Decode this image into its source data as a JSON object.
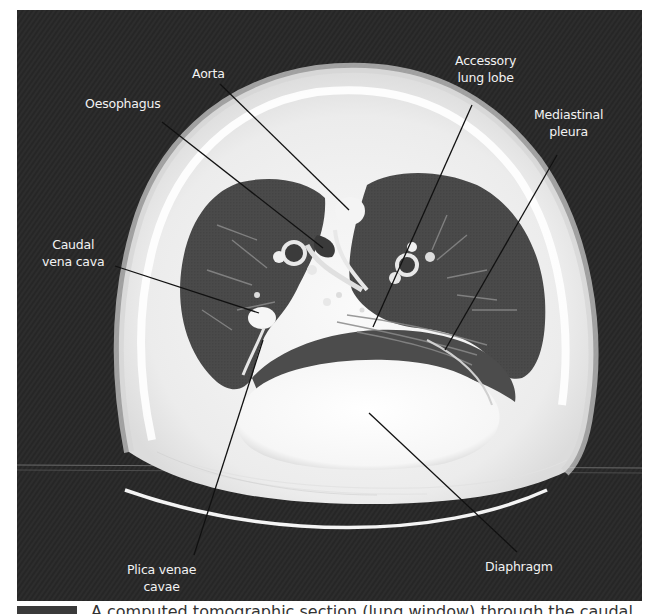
{
  "figure": {
    "type": "CT scan (transverse thoracic section, lung window)",
    "background_color": "#2c2c2c",
    "labels": [
      {
        "id": "aorta",
        "text": "Aorta"
      },
      {
        "id": "oesophagus",
        "text": "Oesophagus"
      },
      {
        "id": "accessory-lung-lobe",
        "line1": "Accessory",
        "line2": "lung lobe"
      },
      {
        "id": "mediastinal-pleura",
        "line1": "Mediastinal",
        "line2": "pleura"
      },
      {
        "id": "caudal-vena-cava",
        "line1": "Caudal",
        "line2": "vena cava"
      },
      {
        "id": "plica-venae-cavae",
        "line1": "Plica venae",
        "line2": "cavae"
      },
      {
        "id": "diaphragm",
        "text": "Diaphragm"
      }
    ]
  },
  "caption": {
    "text": "A computed tomographic section (lung window) through the caudal"
  }
}
